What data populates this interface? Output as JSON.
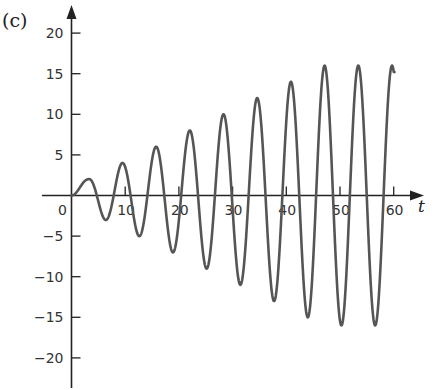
{
  "panel_label": "(c)",
  "colors": {
    "axis": "#222222",
    "curve": "#555555",
    "background": "#ffffff"
  },
  "chart_data": {
    "type": "line",
    "title": "",
    "panel": "(c)",
    "xlabel": "t",
    "ylabel": "",
    "xlim": [
      0,
      62
    ],
    "ylim": [
      -22,
      22
    ],
    "x_ticks": [
      0,
      10,
      20,
      30,
      40,
      50,
      60
    ],
    "x_tick_labels": [
      "0",
      "10",
      "20",
      "30",
      "40",
      "50",
      "60"
    ],
    "y_ticks": [
      -20,
      -15,
      -10,
      -5,
      5,
      10,
      15,
      20
    ],
    "y_tick_labels": [
      "-20",
      "-15",
      "-10",
      "-5",
      "5",
      "10",
      "15",
      "20"
    ],
    "grid": false,
    "legend": null,
    "series": [
      {
        "name": "u(t)",
        "description": "oscillation with linearly growing amplitude, saturating at 16 after t≈47",
        "extrema": [
          {
            "t": 0,
            "u": 0
          },
          {
            "t": 3.1,
            "u": 2
          },
          {
            "t": 6.3,
            "u": -2
          },
          {
            "t": 9.4,
            "u": 4
          },
          {
            "t": 12.6,
            "u": -4
          },
          {
            "t": 15.7,
            "u": 6
          },
          {
            "t": 18.8,
            "u": -6
          },
          {
            "t": 22.0,
            "u": 8
          },
          {
            "t": 25.1,
            "u": -8
          },
          {
            "t": 28.3,
            "u": 10
          },
          {
            "t": 31.4,
            "u": -10
          },
          {
            "t": 34.6,
            "u": 12
          },
          {
            "t": 37.7,
            "u": -12
          },
          {
            "t": 40.8,
            "u": 14
          },
          {
            "t": 44.0,
            "u": -14
          },
          {
            "t": 47.1,
            "u": 16
          },
          {
            "t": 50.3,
            "u": -16
          },
          {
            "t": 53.4,
            "u": 16
          },
          {
            "t": 56.5,
            "u": -16
          },
          {
            "t": 60,
            "u": 15.5
          }
        ],
        "amplitude_cap": 16,
        "angular_frequency": 1,
        "t_end": 60
      }
    ]
  }
}
